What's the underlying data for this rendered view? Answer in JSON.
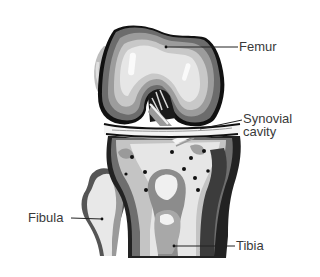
{
  "diagram": {
    "labels": {
      "femur": "Femur",
      "synovial_line1": "Synovial",
      "synovial_line2": "cavity",
      "fibula": "Fibula",
      "tibia": "Tibia"
    },
    "colors": {
      "background": "#ffffff",
      "outline": "#111111",
      "dark_gray": "#555555",
      "mid_gray": "#8a8a8a",
      "light_gray": "#bdbdbd",
      "pale_gray": "#e4e4e4",
      "label_text": "#3a3a3a"
    }
  }
}
